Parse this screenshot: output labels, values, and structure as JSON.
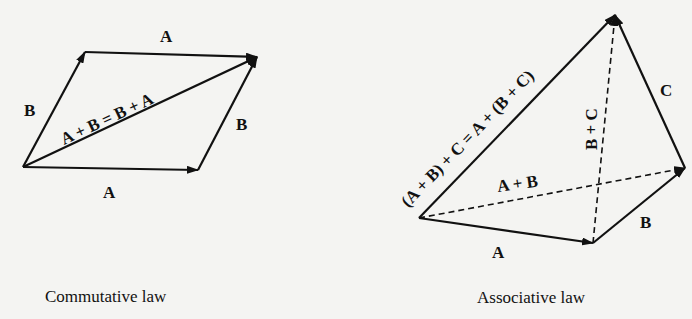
{
  "figures": [
    {
      "id": "commutative",
      "caption": "Commutative law",
      "labels": {
        "top_A": "A",
        "bottom_A": "A",
        "left_B": "B",
        "right_B": "B",
        "diagonal": "A + B = B + A"
      }
    },
    {
      "id": "associative",
      "caption": "Associative law",
      "labels": {
        "A": "A",
        "B": "B",
        "C": "C",
        "A_plus_B": "A + B",
        "B_plus_C": "B + C",
        "resultant": "(A + B) + C = A + (B + C)"
      }
    }
  ],
  "colors": {
    "ink": "#111111",
    "paper": "#f4f4f2"
  }
}
